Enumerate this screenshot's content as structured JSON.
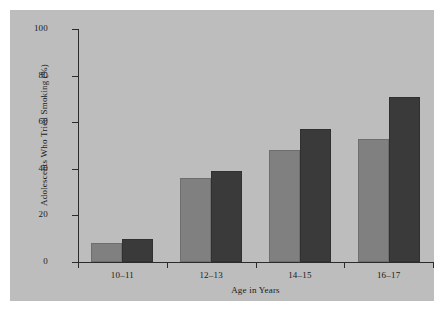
{
  "chart_data": {
    "type": "bar",
    "title": "",
    "subtitle": "",
    "xlabel": "Age in Years",
    "ylabel": "Adolescents Who Tried Smoking (%)",
    "categories": [
      "10–11",
      "12–13",
      "14–15",
      "16–17"
    ],
    "series": [
      {
        "name": "series-1",
        "color": "#808080",
        "values": [
          8,
          36,
          48,
          53
        ]
      },
      {
        "name": "series-2",
        "color": "#3a3a3a",
        "values": [
          10,
          39,
          57,
          71
        ]
      }
    ],
    "ylim": [
      0,
      100
    ],
    "yticks": [
      0,
      20,
      40,
      60,
      80,
      100
    ],
    "ytick_labels": [
      "0",
      "20",
      "40",
      "60",
      "80",
      "100"
    ],
    "grid": false,
    "legend": null,
    "legend_position": "none"
  },
  "figure": {
    "panel_color": "#bdbdbd",
    "page_color": "#ffffff",
    "axis_color": "#2b2b2b"
  }
}
